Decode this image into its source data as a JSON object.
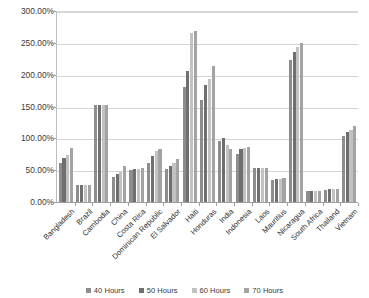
{
  "chart_data": {
    "type": "bar",
    "title": "",
    "xlabel": "",
    "ylabel": "",
    "ylim": [
      0,
      300
    ],
    "ytick_labels": [
      "0.00%",
      "50.00%",
      "100.00%",
      "150.00%",
      "200.00%",
      "250.00%",
      "300.00%"
    ],
    "ytick_values": [
      0,
      50,
      100,
      150,
      200,
      250,
      300
    ],
    "grid": true,
    "legend_position": "bottom",
    "categories": [
      "Bangladesh",
      "Brazil",
      "Cambodia",
      "China",
      "Costa Rica",
      "Dominican Republic",
      "El Salvador",
      "Haiti",
      "Honduras",
      "India",
      "Indonesia",
      "Laos",
      "Mauritius",
      "Nicaragua",
      "South Africa",
      "Thailand",
      "Vietnam"
    ],
    "series": [
      {
        "name": "40 Hours",
        "color": "#8d8d8d",
        "values": [
          61,
          26,
          153,
          40,
          51,
          62,
          52,
          180,
          161,
          96,
          76,
          54,
          35,
          223,
          17,
          19,
          104
        ]
      },
      {
        "name": "50 Hours",
        "color": "#6f6f6f",
        "values": [
          69,
          26,
          153,
          44,
          52,
          72,
          56,
          206,
          184,
          100,
          83,
          54,
          36,
          235,
          18,
          20,
          110
        ]
      },
      {
        "name": "60 Hours",
        "color": "#c2c2c2",
        "values": [
          74,
          26,
          153,
          47,
          52,
          80,
          62,
          265,
          194,
          90,
          85,
          54,
          36,
          243,
          18,
          20,
          113
        ]
      },
      {
        "name": "70 Hours",
        "color": "#a3a3a3",
        "values": [
          85,
          26,
          153,
          57,
          53,
          83,
          68,
          268,
          214,
          84,
          86,
          54,
          37,
          250,
          18,
          20,
          120
        ]
      }
    ]
  },
  "legend": {
    "items": [
      {
        "label": "40 Hours"
      },
      {
        "label": "50 Hours"
      },
      {
        "label": "60 Hours"
      },
      {
        "label": "70 Hours"
      }
    ]
  }
}
